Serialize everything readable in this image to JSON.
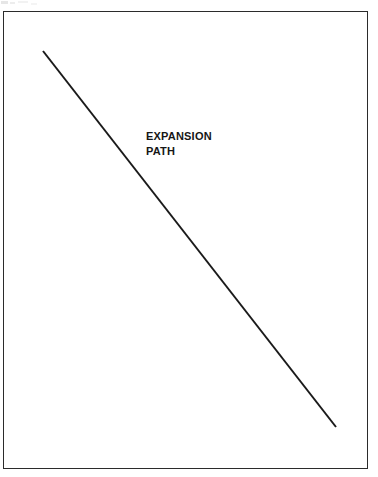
{
  "figure": {
    "background_color": "#ffffff",
    "frame": {
      "name": "figure-border",
      "color": "#2b2b2b",
      "x": 3,
      "y": 11,
      "width": 365,
      "height": 458,
      "stroke_width": 1.6
    },
    "annotations": {
      "expansion_path": {
        "line1": "EXPANSION",
        "line2": "PATH",
        "x": 146,
        "y": 129,
        "color": "#161616"
      }
    }
  },
  "chart_data": {
    "type": "line",
    "title": "",
    "subtitle": "",
    "xlabel": "",
    "ylabel": "",
    "grid": false,
    "legend": null,
    "xlim": [
      3,
      368
    ],
    "ylim": [
      11,
      469
    ],
    "annotations": [
      {
        "text": "EXPANSION PATH",
        "lines": [
          "EXPANSION",
          "PATH"
        ],
        "x": 146,
        "y": 140
      }
    ],
    "series": [
      {
        "name": "expansion path",
        "color": "#1a1a1a",
        "stroke_width": 2,
        "x": [
          43,
          336
        ],
        "y": [
          51,
          427
        ],
        "points": [
          [
            43,
            51
          ],
          [
            336,
            427
          ]
        ]
      }
    ]
  }
}
